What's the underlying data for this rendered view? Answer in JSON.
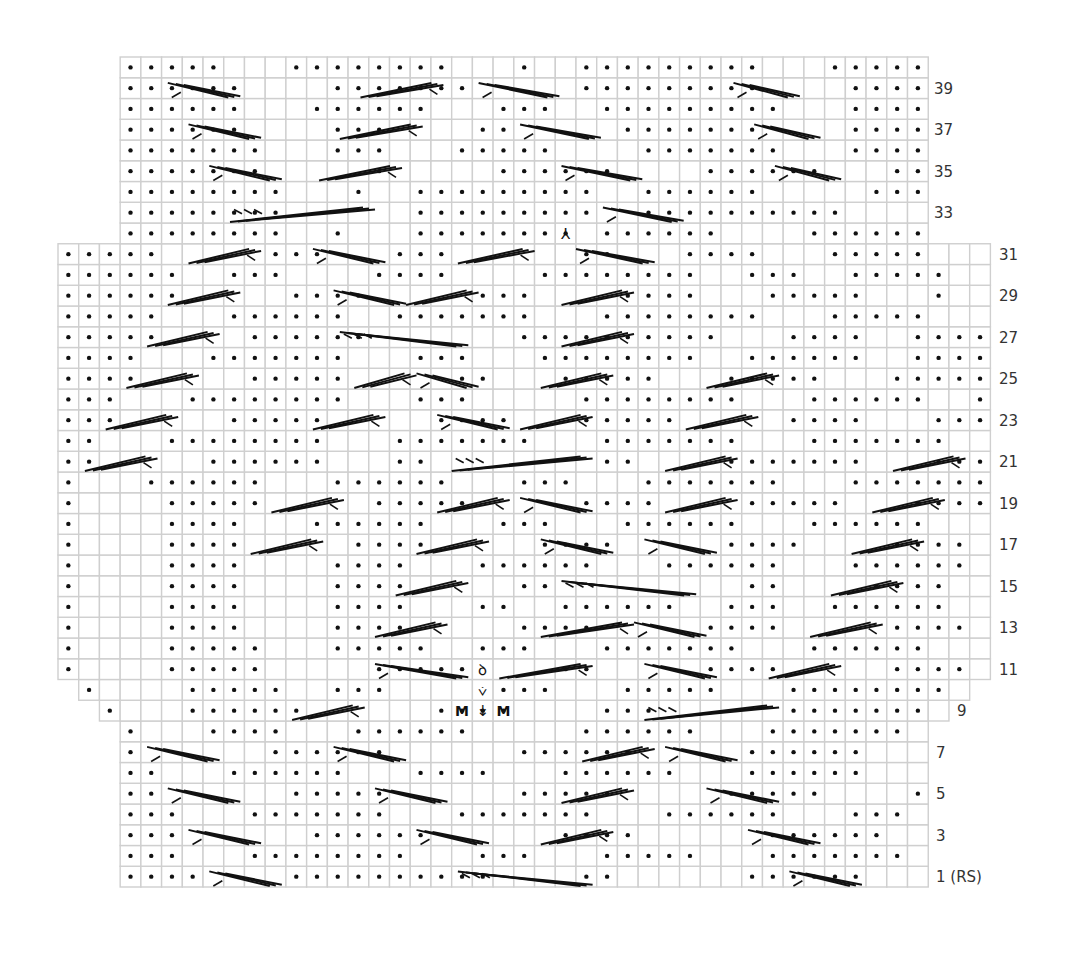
{
  "chart_data": {
    "type": "knitting-chart",
    "grid": {
      "origin_x": 58,
      "origin_y": 57,
      "cell_w": 20.72,
      "cell_h": 20.75,
      "cols": 45,
      "rows": 40,
      "line_color": "#cfcfcf",
      "dot_color": "#111111",
      "cable_color": "#111111"
    },
    "legend_note": "Chart read from bottom (row 1, RS) to top (row 40)",
    "row_extents": {
      "40": [
        3,
        41
      ],
      "39": [
        3,
        41
      ],
      "38": [
        3,
        41
      ],
      "37": [
        3,
        41
      ],
      "36": [
        3,
        41
      ],
      "35": [
        3,
        41
      ],
      "34": [
        3,
        41
      ],
      "33": [
        3,
        41
      ],
      "32": [
        3,
        41
      ],
      "31": [
        0,
        44
      ],
      "30": [
        0,
        44
      ],
      "29": [
        0,
        44
      ],
      "28": [
        0,
        44
      ],
      "27": [
        0,
        44
      ],
      "26": [
        0,
        44
      ],
      "25": [
        0,
        44
      ],
      "24": [
        0,
        44
      ],
      "23": [
        0,
        44
      ],
      "22": [
        0,
        44
      ],
      "21": [
        0,
        44
      ],
      "20": [
        0,
        44
      ],
      "19": [
        0,
        44
      ],
      "18": [
        0,
        44
      ],
      "17": [
        0,
        44
      ],
      "16": [
        0,
        44
      ],
      "15": [
        0,
        44
      ],
      "14": [
        0,
        44
      ],
      "13": [
        0,
        44
      ],
      "12": [
        0,
        44
      ],
      "11": [
        0,
        44
      ],
      "10": [
        1,
        43
      ],
      "9": [
        2,
        42
      ],
      "8": [
        3,
        41
      ],
      "7": [
        3,
        41
      ],
      "6": [
        3,
        41
      ],
      "5": [
        3,
        41
      ],
      "4": [
        3,
        41
      ],
      "3": [
        3,
        41
      ],
      "2": [
        3,
        41
      ],
      "1": [
        3,
        41
      ]
    },
    "rows_pattern": {
      "40": "   .....   ........   .  .........   .....",
      "39": "   ......    .......     .........    ....",
      "38": "   ......   ......   ...  .........   ....",
      "37": "   ......    ...    ..     .......    ....",
      "36": "   .......   ...   .....    .......   ....",
      "35": "   .......     .     ......    ......   ..",
      "34": "   ........   .  .........  ......     ...",
      "33": "   ........      .........  ..........    .",
      "32": "   ........  .   ........ ......    ......",
      "31": ".....     ...   ...      ..   ....   .....   .",
      "30": "......  ...    ....    ........  ...  .....   .",
      "29": "......     ....     ...    ....   .....   .",
      "28": ".....   ......  .......   ........   .....   .",
      "27": ".....    ......       ..........   ....  .....   .",
      "26": "....   .......   ...   ........  ......  .....   .",
      "25": "....     .....     ..   .....   .....   .....   .",
      "24": "...   ........   ...     ........   ......  ......   .",
      "23": "...     .....     ....   .....     ....   .....   .",
      "22": "..   ........   .......   .......   .......  ......",
      "21": "..     ......   ..        ..    .......   .....  ..",
      "20": ".   ......   ......   ...   .......   .......  ....",
      "19": ".    .....     .....     ....    .....   .....   .",
      "18": ".    ....   ......   ...   ......   ......   ....",
      "17": ".    ....     ....     ....     ....    ....   ..",
      "16": ".    ....    ....   ......   ......   ......  ..",
      "15": ".    ....    ....     ..         ..    ....   ..",
      "14": ".    ....    ....   ..  ......  ...  ......   ...",
      "13": ".    ....    ....     ....     ....     ....   .",
      "12": ".    .....   .....  ...   .......   ......   ...",
      "11": ".    .....     .....    ..     ....     ....    .",
      "10": " .    .....  ...     ...   .....   ........ ...",
      "9": "  .   ......      ....    ...      .......   ..",
      "8": "   .   ....   ......     ......   .......    .",
      "7": "   .      ......      ......     ......    ..  .",
      "6": "   ..   ......   ....   ......   ......   ..  .",
      "5": "   ..      .....      .....     .....    ...  .",
      "4": "   ...   .......   .......   ......   ...    .",
      "3": "   ...      ......      ....      ......   .. .",
      "2": "   ...   ........   ...   .....   .......   ..",
      "1": "   ....    ..........    ..      ......   ...."
    },
    "cables": [
      {
        "row": 39,
        "x1": 5.3,
        "x2": 8.8,
        "dir": "down"
      },
      {
        "row": 39,
        "x1": 14.6,
        "x2": 18.6,
        "dir": "up"
      },
      {
        "row": 39,
        "x1": 20.3,
        "x2": 24.2,
        "dir": "down"
      },
      {
        "row": 39,
        "x1": 32.6,
        "x2": 35.8,
        "dir": "down"
      },
      {
        "row": 37,
        "x1": 6.3,
        "x2": 9.8,
        "dir": "down"
      },
      {
        "row": 37,
        "x1": 13.6,
        "x2": 17.6,
        "dir": "up"
      },
      {
        "row": 37,
        "x1": 22.3,
        "x2": 26.2,
        "dir": "down"
      },
      {
        "row": 37,
        "x1": 33.6,
        "x2": 36.8,
        "dir": "down"
      },
      {
        "row": 35,
        "x1": 7.3,
        "x2": 10.8,
        "dir": "down"
      },
      {
        "row": 35,
        "x1": 12.6,
        "x2": 16.6,
        "dir": "up"
      },
      {
        "row": 35,
        "x1": 24.3,
        "x2": 28.2,
        "dir": "down"
      },
      {
        "row": 35,
        "x1": 34.6,
        "x2": 37.8,
        "dir": "down"
      },
      {
        "row": 33,
        "x1": 8.3,
        "x2": 15.3,
        "dir": "long-up"
      },
      {
        "row": 33,
        "x1": 26.3,
        "x2": 30.2,
        "dir": "down"
      },
      {
        "row": 31,
        "x1": 6.3,
        "x2": 9.8,
        "dir": "up"
      },
      {
        "row": 31,
        "x1": 12.3,
        "x2": 15.8,
        "dir": "down"
      },
      {
        "row": 31,
        "x1": 19.3,
        "x2": 23.0,
        "dir": "up"
      },
      {
        "row": 31,
        "x1": 25.0,
        "x2": 28.8,
        "dir": "down"
      },
      {
        "row": 29,
        "x1": 5.3,
        "x2": 8.8,
        "dir": "up"
      },
      {
        "row": 29,
        "x1": 13.3,
        "x2": 16.8,
        "dir": "down"
      },
      {
        "row": 29,
        "x1": 16.8,
        "x2": 20.3,
        "dir": "up"
      },
      {
        "row": 29,
        "x1": 24.3,
        "x2": 27.8,
        "dir": "up"
      },
      {
        "row": 27,
        "x1": 4.3,
        "x2": 7.8,
        "dir": "up"
      },
      {
        "row": 27,
        "x1": 13.6,
        "x2": 19.8,
        "dir": "long-down"
      },
      {
        "row": 27,
        "x1": 24.3,
        "x2": 27.8,
        "dir": "up"
      },
      {
        "row": 25,
        "x1": 3.3,
        "x2": 6.8,
        "dir": "up"
      },
      {
        "row": 25,
        "x1": 14.3,
        "x2": 17.3,
        "dir": "up"
      },
      {
        "row": 25,
        "x1": 17.3,
        "x2": 20.3,
        "dir": "down"
      },
      {
        "row": 25,
        "x1": 23.3,
        "x2": 26.8,
        "dir": "up"
      },
      {
        "row": 25,
        "x1": 31.3,
        "x2": 34.8,
        "dir": "up"
      },
      {
        "row": 23,
        "x1": 2.3,
        "x2": 5.8,
        "dir": "up"
      },
      {
        "row": 23,
        "x1": 12.3,
        "x2": 15.8,
        "dir": "up"
      },
      {
        "row": 23,
        "x1": 18.3,
        "x2": 21.8,
        "dir": "down"
      },
      {
        "row": 23,
        "x1": 22.3,
        "x2": 25.8,
        "dir": "up"
      },
      {
        "row": 23,
        "x1": 30.3,
        "x2": 33.8,
        "dir": "up"
      },
      {
        "row": 21,
        "x1": 1.3,
        "x2": 4.8,
        "dir": "up"
      },
      {
        "row": 21,
        "x1": 19.0,
        "x2": 25.8,
        "dir": "long-up"
      },
      {
        "row": 21,
        "x1": 29.3,
        "x2": 32.8,
        "dir": "up"
      },
      {
        "row": 21,
        "x1": 40.3,
        "x2": 43.8,
        "dir": "up"
      },
      {
        "row": 19,
        "x1": 10.3,
        "x2": 13.8,
        "dir": "up"
      },
      {
        "row": 19,
        "x1": 18.3,
        "x2": 21.8,
        "dir": "up"
      },
      {
        "row": 19,
        "x1": 22.3,
        "x2": 25.8,
        "dir": "down"
      },
      {
        "row": 19,
        "x1": 29.3,
        "x2": 32.8,
        "dir": "up"
      },
      {
        "row": 19,
        "x1": 39.3,
        "x2": 42.8,
        "dir": "up"
      },
      {
        "row": 17,
        "x1": 9.3,
        "x2": 12.8,
        "dir": "up"
      },
      {
        "row": 17,
        "x1": 17.3,
        "x2": 20.8,
        "dir": "up"
      },
      {
        "row": 17,
        "x1": 23.3,
        "x2": 26.8,
        "dir": "down"
      },
      {
        "row": 17,
        "x1": 28.3,
        "x2": 31.8,
        "dir": "down"
      },
      {
        "row": 17,
        "x1": 38.3,
        "x2": 41.8,
        "dir": "up"
      },
      {
        "row": 15,
        "x1": 16.3,
        "x2": 19.8,
        "dir": "up"
      },
      {
        "row": 15,
        "x1": 24.3,
        "x2": 30.8,
        "dir": "long-down"
      },
      {
        "row": 15,
        "x1": 37.3,
        "x2": 40.8,
        "dir": "up"
      },
      {
        "row": 13,
        "x1": 15.3,
        "x2": 18.8,
        "dir": "up"
      },
      {
        "row": 13,
        "x1": 23.3,
        "x2": 27.8,
        "dir": "up"
      },
      {
        "row": 13,
        "x1": 27.8,
        "x2": 31.3,
        "dir": "down"
      },
      {
        "row": 13,
        "x1": 36.3,
        "x2": 39.8,
        "dir": "up"
      },
      {
        "row": 11,
        "x1": 15.3,
        "x2": 19.8,
        "dir": "down"
      },
      {
        "row": 11,
        "x1": 21.3,
        "x2": 25.8,
        "dir": "up"
      },
      {
        "row": 11,
        "x1": 28.3,
        "x2": 31.8,
        "dir": "down"
      },
      {
        "row": 11,
        "x1": 34.3,
        "x2": 37.8,
        "dir": "up"
      },
      {
        "row": 9,
        "x1": 11.3,
        "x2": 14.8,
        "dir": "up"
      },
      {
        "row": 9,
        "x1": 28.3,
        "x2": 34.8,
        "dir": "long-up"
      },
      {
        "row": 7,
        "x1": 4.3,
        "x2": 7.8,
        "dir": "down"
      },
      {
        "row": 7,
        "x1": 13.3,
        "x2": 16.8,
        "dir": "down"
      },
      {
        "row": 7,
        "x1": 25.3,
        "x2": 28.8,
        "dir": "up"
      },
      {
        "row": 7,
        "x1": 29.3,
        "x2": 32.8,
        "dir": "down"
      },
      {
        "row": 5,
        "x1": 5.3,
        "x2": 8.8,
        "dir": "down"
      },
      {
        "row": 5,
        "x1": 15.3,
        "x2": 18.8,
        "dir": "down"
      },
      {
        "row": 5,
        "x1": 24.3,
        "x2": 27.8,
        "dir": "up"
      },
      {
        "row": 5,
        "x1": 31.3,
        "x2": 34.8,
        "dir": "down"
      },
      {
        "row": 3,
        "x1": 6.3,
        "x2": 9.8,
        "dir": "down"
      },
      {
        "row": 3,
        "x1": 17.3,
        "x2": 20.8,
        "dir": "down"
      },
      {
        "row": 3,
        "x1": 23.3,
        "x2": 26.8,
        "dir": "up"
      },
      {
        "row": 3,
        "x1": 33.3,
        "x2": 36.8,
        "dir": "down"
      },
      {
        "row": 1,
        "x1": 7.3,
        "x2": 10.8,
        "dir": "down"
      },
      {
        "row": 1,
        "x1": 19.3,
        "x2": 25.8,
        "dir": "long-down"
      },
      {
        "row": 1,
        "x1": 35.3,
        "x2": 38.8,
        "dir": "down"
      }
    ],
    "special_symbols": [
      {
        "row": 32,
        "col": 24,
        "glyph": "⅄",
        "name": "double-decrease-symbol"
      },
      {
        "row": 11,
        "col": 20,
        "glyph": "ꝺ",
        "name": "make-bobble-symbol"
      },
      {
        "row": 10,
        "col": 20,
        "glyph": "⩒",
        "name": "yarn-over-decrease-symbol"
      },
      {
        "row": 9,
        "col": 19,
        "glyph": "M",
        "name": "make-one-symbol"
      },
      {
        "row": 9,
        "col": 20,
        "glyph": "↡",
        "name": "increase-arrow-symbol"
      },
      {
        "row": 9,
        "col": 21,
        "glyph": "M",
        "name": "make-one-symbol"
      }
    ],
    "row_labels": [
      {
        "row": 39,
        "text": "39",
        "x": 934
      },
      {
        "row": 37,
        "text": "37",
        "x": 934
      },
      {
        "row": 35,
        "text": "35",
        "x": 934
      },
      {
        "row": 33,
        "text": "33",
        "x": 934
      },
      {
        "row": 31,
        "text": "31",
        "x": 999
      },
      {
        "row": 29,
        "text": "29",
        "x": 999
      },
      {
        "row": 27,
        "text": "27",
        "x": 999
      },
      {
        "row": 25,
        "text": "25",
        "x": 999
      },
      {
        "row": 23,
        "text": "23",
        "x": 999
      },
      {
        "row": 21,
        "text": "21",
        "x": 999
      },
      {
        "row": 19,
        "text": "19",
        "x": 999
      },
      {
        "row": 17,
        "text": "17",
        "x": 999
      },
      {
        "row": 15,
        "text": "15",
        "x": 999
      },
      {
        "row": 13,
        "text": "13",
        "x": 999
      },
      {
        "row": 11,
        "text": "11",
        "x": 999
      },
      {
        "row": 9,
        "text": "9",
        "x": 957
      },
      {
        "row": 7,
        "text": "7",
        "x": 936
      },
      {
        "row": 5,
        "text": "5",
        "x": 936
      },
      {
        "row": 3,
        "text": "3",
        "x": 936
      },
      {
        "row": 1,
        "text": "1 (RS)",
        "x": 936
      }
    ]
  }
}
